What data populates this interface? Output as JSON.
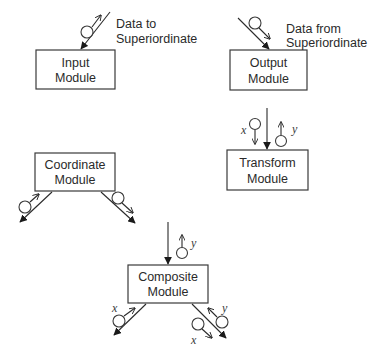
{
  "diagram": {
    "modules": {
      "input": {
        "line1": "Input",
        "line2": "Module"
      },
      "output": {
        "line1": "Output",
        "line2": "Module"
      },
      "transform": {
        "line1": "Transform",
        "line2": "Module"
      },
      "coordinate": {
        "line1": "Coordinate",
        "line2": "Module"
      },
      "composite": {
        "line1": "Composite",
        "line2": "Module"
      }
    },
    "annotations": {
      "data_to": {
        "line1": "Data to",
        "line2": "Superiordinate"
      },
      "data_from": {
        "line1": "Data from",
        "line2": "Superiordinate"
      }
    },
    "variables": {
      "transform_in": "x",
      "transform_out": "y",
      "composite_top_out": "y",
      "composite_left": "x",
      "composite_right_in": "y",
      "composite_right_out": "x"
    },
    "colors": {
      "stroke": "#2a2a2a",
      "background": "#ffffff"
    }
  }
}
